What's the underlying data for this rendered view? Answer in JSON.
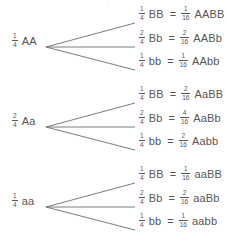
{
  "diagram": {
    "type": "forked-line-genetics-diagram",
    "background_color": "#ffffff",
    "text_color": "#555555",
    "line_color": "#6d6d6d",
    "top_artifact": "·",
    "equals_sign": "=",
    "groups": [
      {
        "parent": {
          "fraction": {
            "numerator": "1",
            "denominator": "4"
          },
          "genotype": "AA"
        },
        "branches": [
          {
            "fraction": {
              "numerator": "1",
              "denominator": "4"
            },
            "genotype": "BB",
            "result_fraction": {
              "numerator": "1",
              "denominator": "16"
            },
            "result_genotype": "AABB"
          },
          {
            "fraction": {
              "numerator": "2",
              "denominator": "4"
            },
            "genotype": "Bb",
            "result_fraction": {
              "numerator": "2",
              "denominator": "16"
            },
            "result_genotype": "AABb"
          },
          {
            "fraction": {
              "numerator": "1",
              "denominator": "4"
            },
            "genotype": "bb",
            "result_fraction": {
              "numerator": "1",
              "denominator": "16"
            },
            "result_genotype": "AAbb"
          }
        ]
      },
      {
        "parent": {
          "fraction": {
            "numerator": "2",
            "denominator": "4"
          },
          "genotype": "Aa"
        },
        "branches": [
          {
            "fraction": {
              "numerator": "1",
              "denominator": "4"
            },
            "genotype": "BB",
            "result_fraction": {
              "numerator": "2",
              "denominator": "16"
            },
            "result_genotype": "AaBB"
          },
          {
            "fraction": {
              "numerator": "2",
              "denominator": "4"
            },
            "genotype": "Bb",
            "result_fraction": {
              "numerator": "4",
              "denominator": "16"
            },
            "result_genotype": "AaBb"
          },
          {
            "fraction": {
              "numerator": "1",
              "denominator": "4"
            },
            "genotype": "bb",
            "result_fraction": {
              "numerator": "2",
              "denominator": "16"
            },
            "result_genotype": "Aabb"
          }
        ]
      },
      {
        "parent": {
          "fraction": {
            "numerator": "1",
            "denominator": "4"
          },
          "genotype": "aa"
        },
        "branches": [
          {
            "fraction": {
              "numerator": "1",
              "denominator": "4"
            },
            "genotype": "BB",
            "result_fraction": {
              "numerator": "1",
              "denominator": "16"
            },
            "result_genotype": "aaBB"
          },
          {
            "fraction": {
              "numerator": "2",
              "denominator": "4"
            },
            "genotype": "Bb",
            "result_fraction": {
              "numerator": "2",
              "denominator": "16"
            },
            "result_genotype": "aaBb"
          },
          {
            "fraction": {
              "numerator": "1",
              "denominator": "4"
            },
            "genotype": "bb",
            "result_fraction": {
              "numerator": "1",
              "denominator": "16"
            },
            "result_genotype": "aabb"
          }
        ]
      }
    ]
  }
}
